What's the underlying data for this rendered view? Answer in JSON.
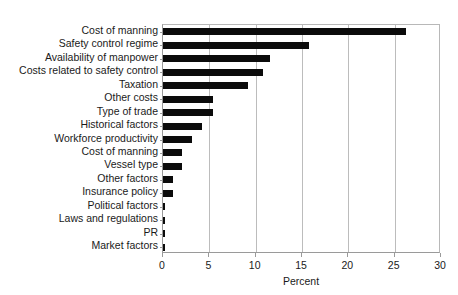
{
  "chart_data": {
    "type": "bar",
    "orientation": "horizontal",
    "title": "",
    "xlabel": "Percent",
    "ylabel": "",
    "xlim": [
      0,
      30
    ],
    "ylim": null,
    "grid": true,
    "legend": null,
    "bar_color": "#0b0b0b",
    "gridline_color": "#bcbcbc",
    "background_color": "#ffffff",
    "xticks": [
      0,
      5,
      10,
      15,
      20,
      25,
      30
    ],
    "xtick_labels": [
      "0",
      "5",
      "10",
      "15",
      "20",
      "25",
      "30"
    ],
    "categories": [
      "Cost of manning",
      "Safety control regime",
      "Availability of manpower",
      "Costs related to safety control",
      "Taxation",
      "Other costs",
      "Type of trade",
      "Historical factors",
      "Workforce productivity",
      "Cost of manning",
      "Vessel type",
      "Other factors",
      "Insurance policy",
      "Political factors",
      "Laws and regulations",
      "PR",
      "Market factors"
    ],
    "values": [
      26.2,
      15.8,
      11.6,
      10.8,
      9.2,
      5.4,
      5.4,
      4.2,
      3.1,
      2.0,
      2.0,
      1.1,
      1.1,
      0.25,
      0.25,
      0.25,
      0.25
    ]
  }
}
